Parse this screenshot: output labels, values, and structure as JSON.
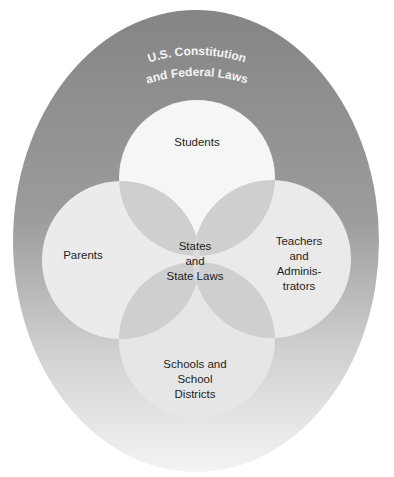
{
  "diagram": {
    "type": "nested-venn",
    "outer": {
      "label_lines": [
        "U.S. Constitution",
        "and Federal Laws"
      ],
      "colors": {
        "top": "#878787",
        "middle": "#a3a3a3",
        "bottom": "#f2f2f2"
      }
    },
    "circles": [
      {
        "id": "students",
        "label_lines": [
          "Students"
        ]
      },
      {
        "id": "parents",
        "label_lines": [
          "Parents"
        ]
      },
      {
        "id": "teachers",
        "label_lines": [
          "Teachers",
          "and",
          "Adminis-",
          "trators"
        ]
      },
      {
        "id": "schools",
        "label_lines": [
          "Schools and",
          "School",
          "Districts"
        ]
      }
    ],
    "center": {
      "label_lines": [
        "States",
        "and",
        "State Laws"
      ]
    },
    "colors": {
      "circle_fill": "#ececec",
      "overlap_fill": "#cdcdcd",
      "center_fill": "#dedede",
      "text": "#1e1e1e"
    }
  }
}
